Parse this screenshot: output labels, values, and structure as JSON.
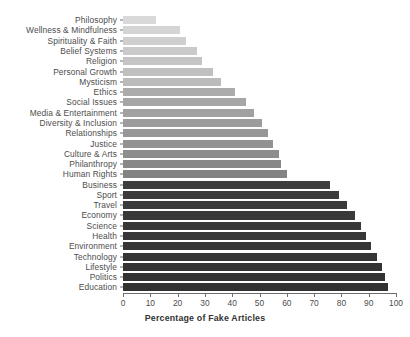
{
  "chart_data": {
    "type": "bar",
    "orientation": "horizontal",
    "title": "",
    "xlabel": "Percentage of Fake Articles",
    "ylabel": "",
    "xlim": [
      0,
      100
    ],
    "xticks": [
      0,
      10,
      20,
      30,
      40,
      50,
      60,
      70,
      80,
      90,
      100
    ],
    "grid": false,
    "legend": null,
    "categories": [
      "Philosophy",
      "Wellness & Mindfulness",
      "Spirituality & Faith",
      "Belief Systems",
      "Religion",
      "Personal Growth",
      "Mysticism",
      "Ethics",
      "Social Issues",
      "Media & Entertainment",
      "Diversity & Inclusion",
      "Relationships",
      "Justice",
      "Culture & Arts",
      "Philanthropy",
      "Human Rights",
      "Business",
      "Sport",
      "Travel",
      "Economy",
      "Science",
      "Health",
      "Environment",
      "Technology",
      "Lifestyle",
      "Politics",
      "Education"
    ],
    "values": [
      12,
      21,
      23,
      27,
      29,
      33,
      36,
      41,
      45,
      48,
      51,
      53,
      55,
      57,
      58,
      60,
      76,
      79,
      82,
      85,
      87,
      89,
      91,
      93,
      95,
      96,
      97
    ],
    "bar_colors": [
      "#d9d9d9",
      "#d4d4d4",
      "#cfcfcf",
      "#cacaca",
      "#c5c5c5",
      "#c0c0c0",
      "#bbbbbb",
      "#ababab",
      "#a6a6a6",
      "#a1a1a1",
      "#9c9c9c",
      "#979797",
      "#929292",
      "#8d8d8d",
      "#888888",
      "#838383",
      "#3d3d3d",
      "#3b3b3b",
      "#3a3a3a",
      "#393939",
      "#383838",
      "#373737",
      "#363636",
      "#353535",
      "#343434",
      "#333333",
      "#323232"
    ]
  },
  "axis": {
    "tick_label_color": "#4d4d4d",
    "axis_line_color": "#6e6e6e",
    "title_color": "#333333"
  },
  "figure": {
    "background": "#ffffff"
  }
}
